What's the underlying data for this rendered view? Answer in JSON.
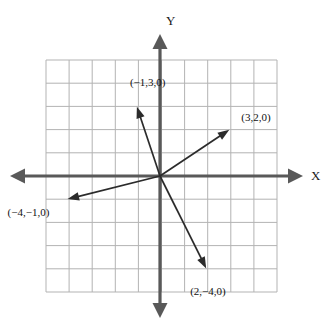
{
  "figure": {
    "kind": "vector-diagram",
    "width": 331,
    "height": 329,
    "background_color": "#ffffff"
  },
  "axes": {
    "x_label": "X",
    "y_label": "Y",
    "axis_color": "#595959",
    "grid_color": "#b3b3b3",
    "origin_px": [
      160,
      176
    ],
    "unit_px": 23.1,
    "x_range": [
      -4.9,
      5.1
    ],
    "y_range": [
      -5.0,
      5.0
    ]
  },
  "grid": {
    "columns": 10,
    "rows": 10,
    "left_px": 46,
    "top_px": 60,
    "right_px": 277,
    "bottom_px": 292,
    "visible": true
  },
  "chart_data": {
    "type": "scatter",
    "title": "",
    "xlabel": "X",
    "ylabel": "Y",
    "xlim": [
      -4.9,
      5.1
    ],
    "ylim": [
      -5.0,
      5.0
    ],
    "grid": true,
    "legend": "none",
    "vectors": [
      {
        "label": "(−1,3,0)",
        "x": -1,
        "y": 3,
        "z": 0,
        "color": "#2b2b2b",
        "label_offset_px": [
          -7,
          -30
        ]
      },
      {
        "label": "(3,2,0)",
        "x": 3,
        "y": 2,
        "z": 0,
        "color": "#2b2b2b",
        "label_offset_px": [
          12,
          -18
        ]
      },
      {
        "label": "(−4,−1,0)",
        "x": -4,
        "y": -1,
        "z": 0,
        "color": "#2b2b2b",
        "label_offset_px": [
          -60,
          8
        ]
      },
      {
        "label": "(2,−4,0)",
        "x": 2,
        "y": -4,
        "z": 0,
        "color": "#2b2b2b",
        "label_offset_px": [
          -16,
          18
        ]
      }
    ]
  }
}
